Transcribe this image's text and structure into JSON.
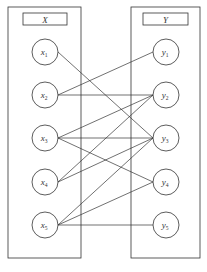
{
  "diagram": {
    "type": "bipartite-graph",
    "left_set": {
      "label": "X",
      "nodes": [
        "x1",
        "x2",
        "x3",
        "x4",
        "x5"
      ]
    },
    "right_set": {
      "label": "Y",
      "nodes": [
        "y1",
        "y2",
        "y3",
        "y4",
        "y5"
      ]
    },
    "edges": [
      [
        "x1",
        "y3"
      ],
      [
        "x2",
        "y1"
      ],
      [
        "x2",
        "y2"
      ],
      [
        "x3",
        "y2"
      ],
      [
        "x3",
        "y3"
      ],
      [
        "x3",
        "y4"
      ],
      [
        "x4",
        "y2"
      ],
      [
        "x4",
        "y3"
      ],
      [
        "x5",
        "y3"
      ],
      [
        "x5",
        "y4"
      ],
      [
        "x5",
        "y5"
      ]
    ],
    "colors": {
      "stroke": "#333333",
      "background": "#ffffff"
    }
  },
  "labels": {
    "X": "X",
    "Y": "Y",
    "x1": {
      "base": "x",
      "sub": "1"
    },
    "x2": {
      "base": "x",
      "sub": "2"
    },
    "x3": {
      "base": "x",
      "sub": "3"
    },
    "x4": {
      "base": "x",
      "sub": "4"
    },
    "x5": {
      "base": "x",
      "sub": "5"
    },
    "y1": {
      "base": "y",
      "sub": "1"
    },
    "y2": {
      "base": "y",
      "sub": "2"
    },
    "y3": {
      "base": "y",
      "sub": "3"
    },
    "y4": {
      "base": "y",
      "sub": "4"
    },
    "y5": {
      "base": "y",
      "sub": "5"
    }
  }
}
